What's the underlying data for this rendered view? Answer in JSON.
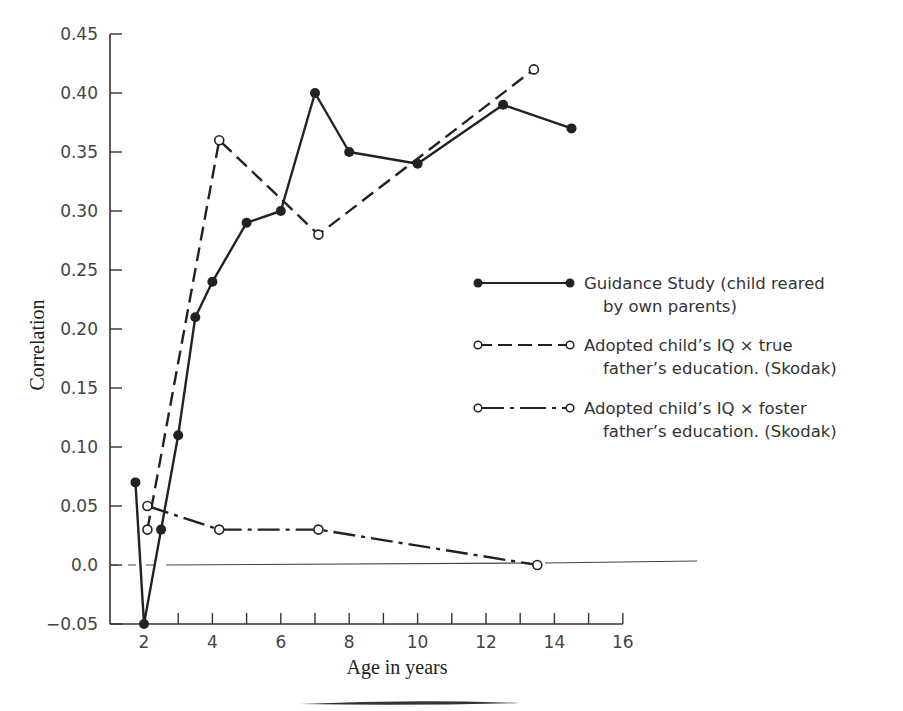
{
  "chart_data": {
    "type": "line",
    "title": "",
    "xlabel": "Age in years",
    "ylabel": "Correlation",
    "xlim": [
      1,
      16
    ],
    "ylim": [
      -0.05,
      0.45
    ],
    "x_ticks": [
      2,
      4,
      6,
      8,
      10,
      12,
      14,
      16
    ],
    "x_tick_labels": [
      "2",
      "4",
      "6",
      "8",
      "10",
      "12",
      "14",
      "16"
    ],
    "x_minor_ticks": [
      3,
      5,
      7,
      9,
      11,
      13,
      15
    ],
    "y_ticks": [
      -0.05,
      0.0,
      0.05,
      0.1,
      0.15,
      0.2,
      0.25,
      0.3,
      0.35,
      0.4,
      0.45
    ],
    "y_tick_labels": [
      "−0.05",
      "0.0",
      "0.05",
      "0.10",
      "0.15",
      "0.20",
      "0.25",
      "0.30",
      "0.35",
      "0.40",
      "0.45"
    ],
    "grid": false,
    "reference_line": {
      "y": 0.0,
      "style": "solid, dashed near y-axis"
    },
    "legend_position": "right",
    "series": [
      {
        "name": "Guidance Study (child reared by own parents)",
        "legend_lines": [
          "Guidance Study (child reared",
          "by own parents)"
        ],
        "line_style": "solid",
        "marker": "filled-circle",
        "x": [
          1.75,
          2,
          2.5,
          3,
          3.5,
          4,
          5,
          6,
          7,
          8,
          10,
          12.5,
          14.5
        ],
        "values": [
          0.07,
          -0.05,
          0.03,
          0.11,
          0.21,
          0.24,
          0.29,
          0.3,
          0.4,
          0.35,
          0.34,
          0.39,
          0.37
        ]
      },
      {
        "name": "Adopted child's IQ X true father's education. (Skodak)",
        "legend_lines": [
          "Adopted child’s IQ × true",
          "father’s education. (Skodak)"
        ],
        "line_style": "dashed",
        "marker": "open-circle",
        "x": [
          2.1,
          4.2,
          7.1,
          13.4
        ],
        "values": [
          0.03,
          0.36,
          0.28,
          0.42
        ]
      },
      {
        "name": "Adopted child's IQ X foster father's education. (Skodak)",
        "legend_lines": [
          "Adopted child’s IQ × foster",
          "father’s education. (Skodak)"
        ],
        "line_style": "dash-dot",
        "marker": "open-circle",
        "x": [
          2.1,
          4.2,
          7.1,
          13.5
        ],
        "values": [
          0.05,
          0.03,
          0.03,
          0.0
        ]
      }
    ]
  },
  "colors": {
    "ink": "#222222",
    "axis": "#333333",
    "background": "#ffffff"
  }
}
